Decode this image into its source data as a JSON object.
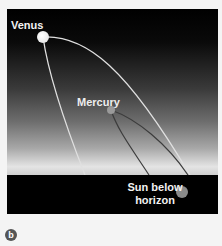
{
  "figure": {
    "panel_label": "b",
    "labels": {
      "venus": "Venus",
      "mercury": "Mercury",
      "sun": "Sun below horizon"
    },
    "colors": {
      "sky_top": "#000000",
      "sky_horizon": "#e4e4e4",
      "ground": "#000000",
      "venus_orbit": "#e8e8e8",
      "mercury_orbit": "#444444",
      "venus_dot": "#f0f0f0",
      "mercury_dot": "#9a9a9a",
      "sun_dot": "#8a8a8a"
    }
  }
}
